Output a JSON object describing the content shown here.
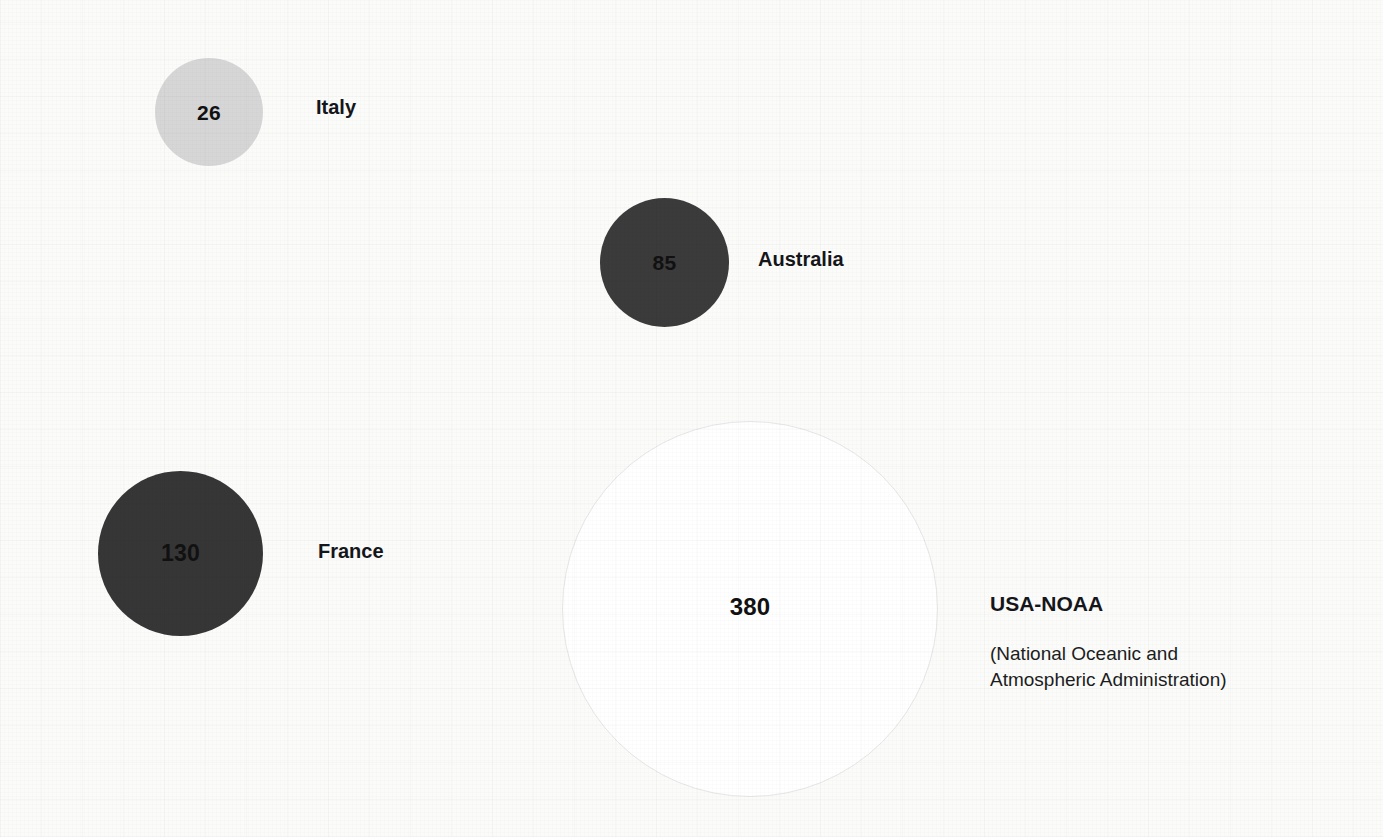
{
  "chart_data": {
    "type": "bubble",
    "title": "",
    "xlabel": "",
    "ylabel": "",
    "legend_position": "inline-right-of-bubble",
    "grid": false,
    "categories": [
      "Italy",
      "Australia",
      "France",
      "USA-NOAA"
    ],
    "values": [
      26,
      85,
      130,
      380
    ],
    "series": [
      {
        "name": "bubble-size",
        "values": [
          26,
          85,
          130,
          380
        ]
      }
    ],
    "points": [
      {
        "label": "Italy",
        "sublabel": "",
        "value": 26,
        "value_text": "26",
        "color": "#d6d6d6",
        "value_color": "#111111"
      },
      {
        "label": "Australia",
        "sublabel": "",
        "value": 85,
        "value_text": "85",
        "color": "#3b3b3b",
        "value_color": "#111111"
      },
      {
        "label": "France",
        "sublabel": "",
        "value": 130,
        "value_text": "130",
        "color": "#363636",
        "value_color": "#111111"
      },
      {
        "label": "USA-NOAA",
        "sublabel": "(National Oceanic and\nAtmospheric Administration)",
        "value": 380,
        "value_text": "380",
        "color": "#ffffff",
        "value_color": "#111111"
      }
    ]
  },
  "colors": {
    "background": "#fbfbfa",
    "light_gray_bubble": "#d6d6d6",
    "dark_bubble": "#3b3b3b",
    "darker_bubble": "#363636",
    "white_bubble": "#ffffff",
    "white_bubble_stroke": "#e6e6e6",
    "text": "#15161a"
  }
}
